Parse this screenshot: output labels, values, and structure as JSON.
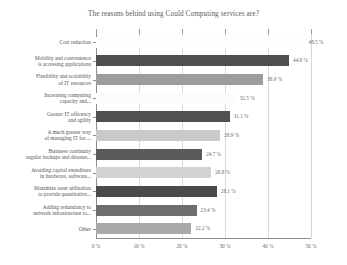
{
  "chart_data": {
    "type": "bar",
    "orientation": "horizontal",
    "title": "The reasons behind using Could Computing services are?",
    "xlabel": "",
    "ylabel": "",
    "xlim": [
      0,
      50
    ],
    "grid": true,
    "legend": false,
    "xticks": [
      "0 %",
      "10 %",
      "20 %",
      "30 %",
      "40 %",
      "50 %"
    ],
    "xtick_values": [
      0,
      10,
      20,
      30,
      40,
      50
    ],
    "categories": [
      "Cost reduction",
      "Mobility and convenience\nis accessing applications",
      "Flexibility  and scalability\nof IT resources",
      "Increasing computing\ncapacity and...",
      "Greater IT officency\nand agility",
      "A much greater way\nof managing IT for ...",
      "Business continuity\nregular backups and disaster...",
      "Avoiding capital exenditure\nin hardware, software...",
      "Maximize asset utilization\nto provide quantitative...",
      "Adding redundancy to\nnetwork infrastructure to...",
      "Other"
    ],
    "values": [
      48.5,
      44.9,
      38.9,
      32.5,
      31.1,
      28.9,
      24.7,
      26.8,
      28.1,
      23.4,
      22.2
    ],
    "value_labels": [
      "48.5 %",
      "44.9 %",
      "38.9 %",
      "32.5 %",
      "31.1 %",
      "28.9 %",
      "24.7 %",
      "26.8 %",
      "28.1 %",
      "23.4 %",
      "22.2 %"
    ],
    "bar_colors": [
      "#fdfdfd",
      "#4e4e4e",
      "#9d9d9d",
      "#fbfbfb",
      "#505050",
      "#c9c9c9",
      "#5a5a5a",
      "#d2d2d2",
      "#4a4a4a",
      "#6e6e6e",
      "#a9a9a9"
    ]
  }
}
